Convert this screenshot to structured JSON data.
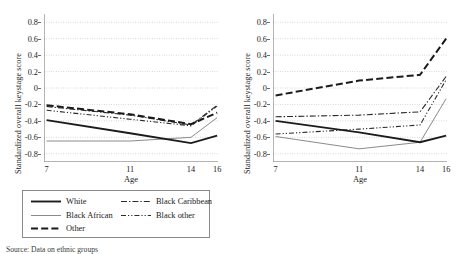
{
  "figure": {
    "ylabel": "Standardized overall keystage score",
    "xlabel": "Age",
    "caption": "Source: Data on ethnic groups"
  },
  "axis": {
    "yticks": [
      "0.8",
      "0.6",
      "0.4",
      "0.2",
      "0",
      "-0.2",
      "-0.4",
      "-0.6",
      "-0.8"
    ],
    "xticks": [
      "7",
      "11",
      "14",
      "16"
    ],
    "ylim": [
      -0.9,
      0.9
    ],
    "grid": "dotted"
  },
  "legend_left": {
    "items": [
      {
        "label": "White",
        "style": "thick-solid"
      },
      {
        "label": "Black African",
        "style": "thin-solid"
      },
      {
        "label": "Other",
        "style": "thick-dashed"
      },
      {
        "label": "Black Caribbean",
        "style": "dash-dot"
      },
      {
        "label": "Black other",
        "style": "dash-dot-dot"
      }
    ]
  },
  "legend_right": {
    "items": [
      {
        "label": "White",
        "style": "thick-solid"
      },
      {
        "label": "Pakistani",
        "style": "thin-solid"
      },
      {
        "label": "Chinese",
        "style": "thick-dashed"
      },
      {
        "label": "Indian",
        "style": "dash-dot"
      },
      {
        "label": "Bangladeshi",
        "style": "dash-dot-dot"
      }
    ]
  },
  "chart_data": [
    {
      "type": "line",
      "panel": "left",
      "title": "",
      "xlabel": "Age",
      "ylabel": "Standardized overall keystage score",
      "x": [
        7,
        11,
        14,
        16
      ],
      "ylim": [
        -0.9,
        0.9
      ],
      "xticks": [
        7,
        11,
        14,
        16
      ],
      "yticks": [
        -0.8,
        -0.6,
        -0.4,
        -0.2,
        0,
        0.2,
        0.4,
        0.6,
        0.8
      ],
      "grid": true,
      "legend_position": "below",
      "series": [
        {
          "name": "White",
          "style": "thick-solid",
          "values": [
            -0.39,
            -0.55,
            -0.67,
            -0.58
          ]
        },
        {
          "name": "Black African",
          "style": "thin-solid",
          "values": [
            -0.645,
            -0.645,
            -0.6,
            -0.36
          ]
        },
        {
          "name": "Other",
          "style": "thick-dashed",
          "values": [
            -0.21,
            -0.32,
            -0.44,
            -0.3
          ]
        },
        {
          "name": "Black Caribbean",
          "style": "dash-dot",
          "values": [
            -0.225,
            -0.33,
            -0.45,
            -0.21
          ]
        },
        {
          "name": "Black other",
          "style": "dash-dot-dot",
          "values": [
            -0.27,
            -0.38,
            -0.46,
            -0.22
          ]
        }
      ]
    },
    {
      "type": "line",
      "panel": "right",
      "title": "",
      "xlabel": "Age",
      "ylabel": "Standardized overall keystage score",
      "x": [
        7,
        11,
        14,
        16
      ],
      "ylim": [
        -0.9,
        0.9
      ],
      "xticks": [
        7,
        11,
        14,
        16
      ],
      "yticks": [
        -0.8,
        -0.6,
        -0.4,
        -0.2,
        0,
        0.2,
        0.4,
        0.6,
        0.8
      ],
      "grid": true,
      "legend_position": "below",
      "series": [
        {
          "name": "White",
          "style": "thick-solid",
          "values": [
            -0.4,
            -0.54,
            -0.66,
            -0.58
          ]
        },
        {
          "name": "Pakistani",
          "style": "thin-solid",
          "values": [
            -0.59,
            -0.74,
            -0.66,
            -0.13
          ]
        },
        {
          "name": "Chinese",
          "style": "thick-dashed",
          "values": [
            -0.09,
            0.09,
            0.16,
            0.6
          ]
        },
        {
          "name": "Indian",
          "style": "dash-dot",
          "values": [
            -0.35,
            -0.33,
            -0.29,
            0.14
          ]
        },
        {
          "name": "Bangladeshi",
          "style": "dash-dot-dot",
          "values": [
            -0.56,
            -0.5,
            -0.45,
            0.1
          ]
        }
      ]
    }
  ]
}
